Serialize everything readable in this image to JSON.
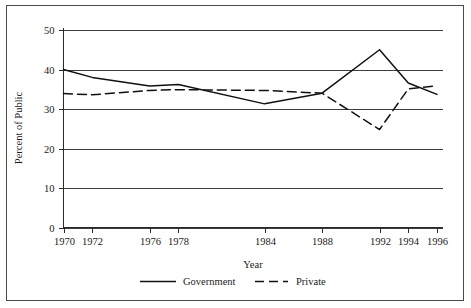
{
  "chart_data": {
    "type": "line",
    "title": "",
    "xlabel": "Year",
    "ylabel": "Percent of Public",
    "x": [
      1970,
      1972,
      1976,
      1978,
      1984,
      1988,
      1992,
      1994,
      1996
    ],
    "xtick_labels": [
      "1970",
      "1972",
      "1976",
      "1978",
      "1984",
      "1988",
      "1992",
      "1994",
      "1996"
    ],
    "ytick_labels": [
      "0",
      "10",
      "20",
      "30",
      "40",
      "50"
    ],
    "yticks": [
      0,
      10,
      20,
      30,
      40,
      50
    ],
    "ylim": [
      0,
      50
    ],
    "xlim": [
      1970,
      1996
    ],
    "grid": "horizontal",
    "legend_position": "below-axis",
    "series": [
      {
        "name": "Government",
        "style": "solid",
        "color": "#111111",
        "values": [
          40.0,
          38.0,
          35.8,
          36.2,
          31.3,
          34.0,
          45.0,
          36.6,
          33.7
        ]
      },
      {
        "name": "Private",
        "style": "dashed",
        "color": "#111111",
        "values": [
          33.9,
          33.6,
          34.7,
          34.9,
          34.7,
          34.0,
          24.8,
          35.1,
          35.9
        ]
      }
    ]
  },
  "legend": {
    "entries": [
      {
        "label": "Government",
        "style": "solid"
      },
      {
        "label": "Private",
        "style": "dashed"
      }
    ]
  },
  "axes": {
    "x_title": "Year",
    "y_title": "Percent of Public"
  },
  "colors": {
    "line": "#111111",
    "grid": "#3c3c3c",
    "axis": "#2b2b2b",
    "frame": "#4a4a4a",
    "background": "#ffffff"
  }
}
